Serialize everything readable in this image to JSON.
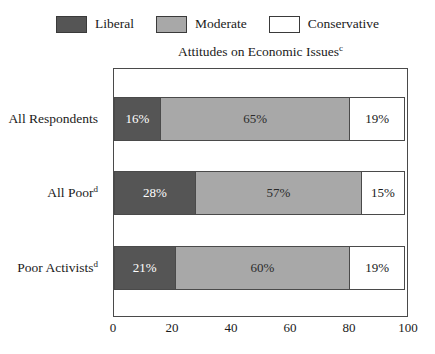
{
  "legend": {
    "entries": [
      {
        "label": "Liberal",
        "color": "#555555",
        "icon": "legend-swatch-liberal"
      },
      {
        "label": "Moderate",
        "color": "#a8a8a8",
        "icon": "legend-swatch-moderate"
      },
      {
        "label": "Conservative",
        "color": "#ffffff",
        "icon": "legend-swatch-conservative"
      }
    ]
  },
  "title": {
    "text": "Attitudes on Economic Issues",
    "footnote": "c"
  },
  "categories": [
    {
      "label": "All Respondents",
      "footnote": ""
    },
    {
      "label": "All Poor",
      "footnote": "d"
    },
    {
      "label": "Poor Activists",
      "footnote": "d"
    }
  ],
  "bars": [
    {
      "liberal": "16%",
      "moderate": "65%",
      "conservative": "19%"
    },
    {
      "liberal": "28%",
      "moderate": "57%",
      "conservative": "15%"
    },
    {
      "liberal": "21%",
      "moderate": "60%",
      "conservative": "19%"
    }
  ],
  "x_axis": {
    "ticks": [
      "0",
      "20",
      "40",
      "60",
      "80",
      "100"
    ]
  },
  "chart_data": {
    "type": "bar",
    "orientation": "horizontal",
    "stacked": true,
    "title": "Attitudes on Economic Issues",
    "title_footnote": "c",
    "xlabel": "",
    "ylabel": "",
    "xlim": [
      0,
      100
    ],
    "xticks": [
      0,
      20,
      40,
      60,
      80,
      100
    ],
    "grid": false,
    "legend_position": "top-center",
    "categories": [
      "All Respondents",
      "All Poor",
      "Poor Activists"
    ],
    "category_footnotes": [
      "",
      "d",
      "d"
    ],
    "series": [
      {
        "name": "Liberal",
        "color": "#555555",
        "values": [
          16,
          28,
          21
        ],
        "labels": [
          "16%",
          "28%",
          "21%"
        ]
      },
      {
        "name": "Moderate",
        "color": "#a8a8a8",
        "values": [
          65,
          57,
          60
        ],
        "labels": [
          "65%",
          "57%",
          "60%"
        ]
      },
      {
        "name": "Conservative",
        "color": "#ffffff",
        "values": [
          19,
          15,
          19
        ],
        "labels": [
          "19%",
          "15%",
          "19%"
        ]
      }
    ]
  }
}
